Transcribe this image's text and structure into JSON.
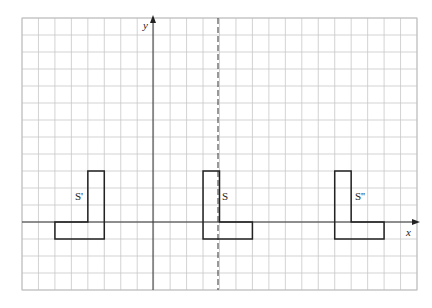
{
  "figure": {
    "type": "coordinate-grid-transformation",
    "axes": {
      "x_label": "x",
      "y_label": "y"
    },
    "grid": {
      "x_min": -8,
      "x_max": 16,
      "y_min": -4,
      "y_max": 12
    },
    "mirror_line": {
      "style": "dashed",
      "x": 4
    },
    "shapes": [
      {
        "id": "S",
        "label": "S",
        "vertices": [
          [
            3,
            3
          ],
          [
            4,
            3
          ],
          [
            4,
            0
          ],
          [
            6,
            0
          ],
          [
            6,
            -1
          ],
          [
            3,
            -1
          ]
        ]
      },
      {
        "id": "S_prime",
        "label": "S'",
        "vertices": [
          [
            -4,
            3
          ],
          [
            -3,
            3
          ],
          [
            -3,
            -1
          ],
          [
            -6,
            -1
          ],
          [
            -6,
            0
          ],
          [
            -4,
            0
          ]
        ]
      },
      {
        "id": "S_double_prime",
        "label": "S''",
        "vertices": [
          [
            11,
            3
          ],
          [
            12,
            3
          ],
          [
            12,
            0
          ],
          [
            14,
            0
          ],
          [
            14,
            -1
          ],
          [
            11,
            -1
          ]
        ]
      }
    ]
  }
}
